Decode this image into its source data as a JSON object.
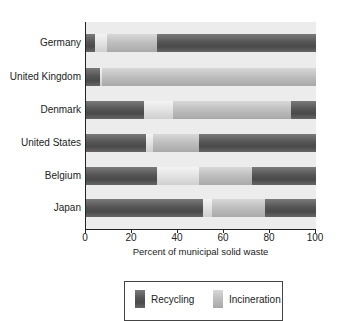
{
  "chart_data": {
    "type": "bar",
    "orientation": "horizontal",
    "stacked": true,
    "title": "",
    "xlabel": "Percent of municipal solid waste",
    "ylabel": "",
    "xlim": [
      0,
      100
    ],
    "xticks": [
      "0",
      "20",
      "40",
      "60",
      "80",
      "100"
    ],
    "categories": [
      "Germany",
      "United Kingdom",
      "Denmark",
      "United States",
      "Belgium",
      "Japan"
    ],
    "series": [
      {
        "name": "Recycling",
        "style": "dark",
        "values": [
          4,
          6,
          25,
          26,
          31,
          51
        ]
      },
      {
        "name": "",
        "style": "white",
        "values": [
          5,
          1,
          13,
          3,
          18,
          4
        ]
      },
      {
        "name": "Incineration",
        "style": "light",
        "values": [
          22,
          93,
          51,
          20,
          23,
          23
        ]
      },
      {
        "name": "",
        "style": "dark",
        "values": [
          69,
          0,
          11,
          51,
          28,
          22
        ]
      }
    ],
    "legend": {
      "position": "bottom",
      "entries": [
        "Recycling",
        "Incineration"
      ]
    },
    "grid": false
  }
}
